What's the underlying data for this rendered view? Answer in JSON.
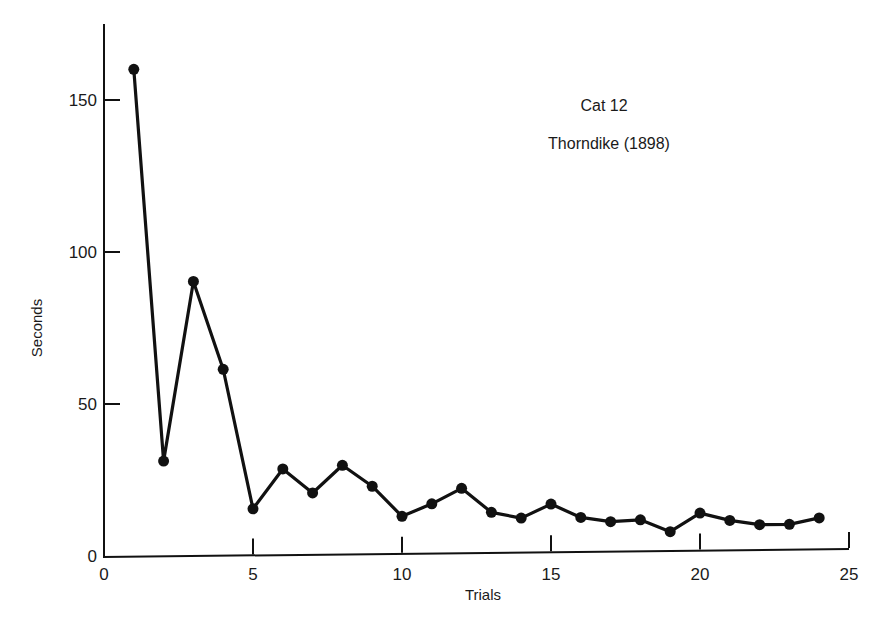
{
  "chart_data": {
    "type": "line",
    "title": "",
    "annotations": [
      "Cat 12",
      "Thorndike (1898)"
    ],
    "xlabel": "Trials",
    "ylabel": "Seconds",
    "xlim": [
      0,
      25
    ],
    "ylim": [
      0,
      175
    ],
    "xticks": [
      0,
      5,
      10,
      15,
      20,
      25
    ],
    "yticks": [
      0,
      50,
      100,
      150
    ],
    "grid": false,
    "legend": null,
    "series": [
      {
        "name": "Cat 12",
        "marker": "filled-circle",
        "color": "#111111",
        "x": [
          1,
          2,
          3,
          4,
          5,
          6,
          7,
          8,
          9,
          10,
          11,
          12,
          13,
          14,
          15,
          16,
          17,
          18,
          19,
          20,
          21,
          22,
          23,
          24
        ],
        "values": [
          160,
          31,
          90,
          61,
          15,
          28,
          20,
          29,
          22,
          12,
          16,
          21,
          13,
          11,
          15.5,
          11,
          9.5,
          10,
          6,
          12,
          9.5,
          8,
          8,
          10
        ]
      }
    ]
  },
  "labels": {
    "annotation_line1": "Cat 12",
    "annotation_line2": "Thorndike (1898)",
    "xlabel": "Trials",
    "ylabel": "Seconds"
  }
}
